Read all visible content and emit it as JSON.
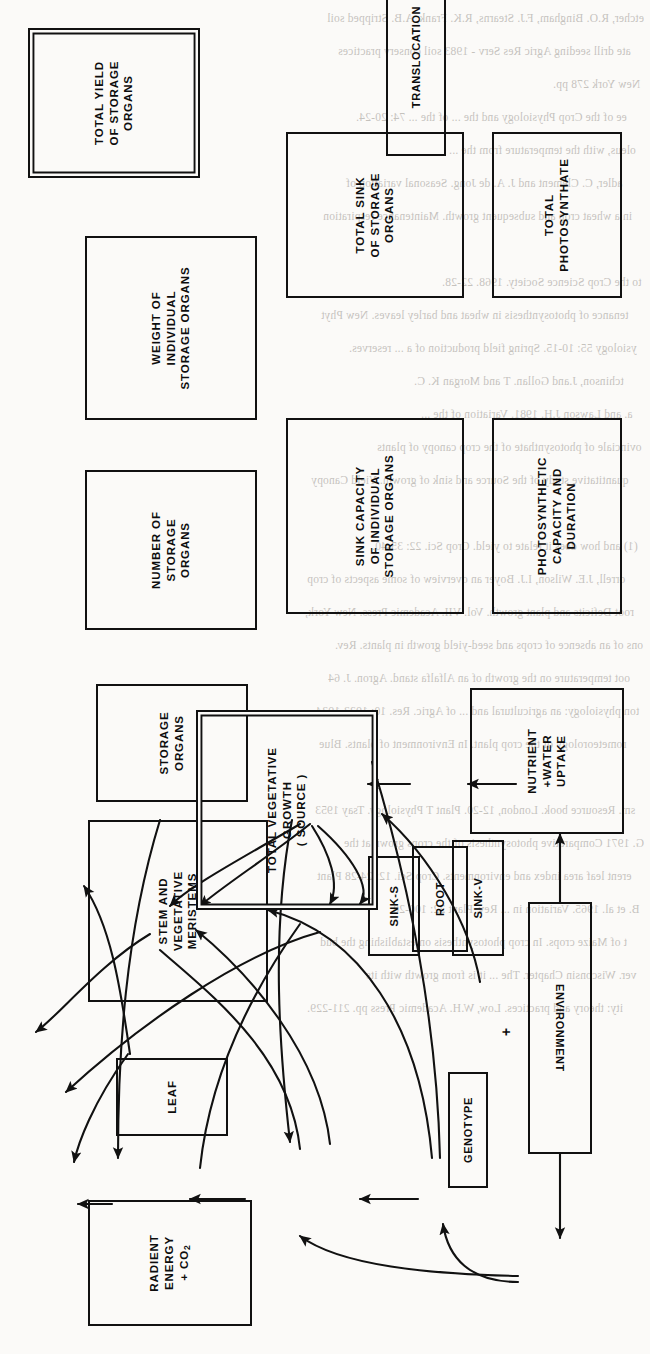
{
  "diagram": {
    "orientation": "rotated-90-ccw",
    "stroke_color": "#111111",
    "background_color": "#fbfaf8",
    "nodes": [
      {
        "id": "total_yield",
        "label_lines": [
          "TOTAL YIELD",
          "OF STORAGE",
          "ORGANS"
        ],
        "double_border": true,
        "flipped": false
      },
      {
        "id": "weight_individual",
        "label_lines": [
          "WEIGHT OF",
          "INDIVIDUAL",
          "STORAGE ORGANS"
        ],
        "double_border": false,
        "flipped": false
      },
      {
        "id": "number_organs",
        "label_lines": [
          "NUMBER OF",
          "STORAGE",
          "ORGANS"
        ],
        "double_border": false,
        "flipped": false
      },
      {
        "id": "storage_organs",
        "label_lines": [
          "STORAGE",
          "ORGANS"
        ],
        "double_border": false,
        "flipped": false
      },
      {
        "id": "stem_meristems",
        "label_lines": [
          "STEM AND",
          "VEGETATIVE",
          "MERISTEMS"
        ],
        "double_border": false,
        "flipped": false
      },
      {
        "id": "leaf",
        "label_lines": [
          "LEAF"
        ],
        "double_border": false,
        "flipped": false
      },
      {
        "id": "radiant_energy",
        "label_lines": [
          "RADIENT",
          "ENERGY",
          "+ CO2"
        ],
        "double_border": false,
        "flipped": false
      },
      {
        "id": "total_sink",
        "label_lines": [
          "TOTAL SINK",
          "OF STORAGE",
          "ORGANS"
        ],
        "double_border": false,
        "flipped": false
      },
      {
        "id": "sink_capacity",
        "label_lines": [
          "SINK CAPACITY",
          "OF INDIVIDUAL",
          "STORAGE ORGANS"
        ],
        "double_border": false,
        "flipped": false
      },
      {
        "id": "sink_s",
        "label_lines": [
          "SINK-S"
        ],
        "double_border": false,
        "flipped": false
      },
      {
        "id": "sink_v",
        "label_lines": [
          "SINK-V"
        ],
        "double_border": false,
        "flipped": false
      },
      {
        "id": "genotype",
        "label_lines": [
          "GENOTYPE"
        ],
        "double_border": false,
        "flipped": false
      },
      {
        "id": "environment",
        "label_lines": [
          "ENVIRONMENT"
        ],
        "double_border": false,
        "flipped": true
      },
      {
        "id": "total_photo",
        "label_lines": [
          "TOTAL",
          "PHOTOSYNTHATE"
        ],
        "double_border": false,
        "flipped": false
      },
      {
        "id": "photo_capacity",
        "label_lines": [
          "PHOTOSYNTHETIC",
          "CAPACITY AND",
          "DURATION"
        ],
        "double_border": false,
        "flipped": false
      },
      {
        "id": "translocation",
        "label_lines": [
          "TRANSLOCATION"
        ],
        "double_border": false,
        "flipped": false
      },
      {
        "id": "total_veg",
        "label_lines": [
          "TOTAL VEGETATIVE",
          "GROWTH",
          "( SOURCE )"
        ],
        "double_border": true,
        "flipped": false
      },
      {
        "id": "root",
        "label_lines": [
          "ROOT"
        ],
        "double_border": false,
        "flipped": false
      },
      {
        "id": "nutrient_water",
        "label_lines": [
          "NUTRIENT",
          "+WATER",
          "UPTAKE"
        ],
        "double_border": false,
        "flipped": false
      }
    ],
    "junction_symbols": [
      {
        "id": "plus_genotype_environment",
        "glyph": "+"
      }
    ]
  },
  "bleed_through_text": [
    "etcher, R.O. Bingham, F.J. Stearns, R.K. Frank, A.B. Stripped soil",
    "ate drill seeding Agric Res Serv - 1983 soil conserv practices",
    "New York 278 pp.",
    "ee of the Crop Physiology and the ... of the ... 74: 20-24.",
    "oleus, with the temperature from the ...",
    "adler, C. Clement and J. A. de Jong.  Seasonal variation of",
    "in a wheat crop and subsequent growth. Maintenance respiration",
    "to the Crop Science Society. 1968. 22-28.",
    "tenance of photosynthesis in wheat and barley leaves. New Phyt",
    "ysiology 55: 10-15. Spring field production of a ... reserves.",
    "tchinson, J.and Gollan. T and Morgan K. C.",
    "a. and Lawson J.H. 1981. Variation of the ...",
    "ovinciale of photosynthate of the crop canopy of plants",
    "quantitative study of the Source and sink of growth. Yield Canopy",
    "(1) and how does it relate to yield.  Crop Sci. 22: 35-40.",
    "orrell, J.E. Wilson, I.J. Boyer an overview of some aspects of crop",
    "root Deficits and plant growth.  Vol. VII. Academic Press. New York,",
    "ons of an absence of crops and seed-yield growth in plants. Rev.",
    "oot temperature on the growth of an Alfalfa stand. Agron. J. 64",
    "ton physiology: an agricultural and ... of Agric. Res. 10: 1923-1934.",
    "rometeorology of the crop plant. In Environment of plants. Blue",
    "sm. Resource book. London, 12-20. Plant T Physiology. Tsay 1953",
    "G. 1971 Comparative photosynthesis of the crops grown at the",
    "erent leaf area index and environments.  Crop Sci. 12: 24-28 Plant",
    "B. et al. 1965. Variation in ... Rev. Plant 22: 100-20.",
    "t of Maize crops. In crop photosynthesis on establishing the bud",
    "ver. Wisconsin Chapter. The ... it is from growth with its",
    "ity: theory and practices. Low, W.H. Academic Press pp. 211-229."
  ]
}
